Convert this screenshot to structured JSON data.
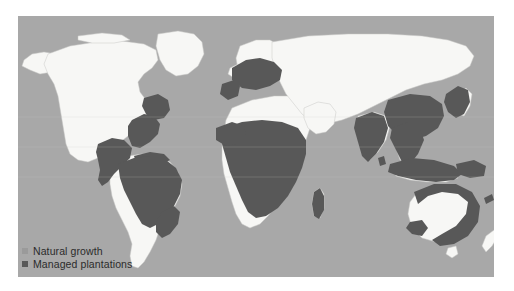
{
  "figure": {
    "type": "world-map",
    "projection": "equirectangular",
    "ocean_color": "#a8a8a8",
    "land_color": "#f7f7f5",
    "border_color": "#c9c9c7",
    "highlight_color": "#585858",
    "page_background": "#ffffff"
  },
  "legend": {
    "items": [
      {
        "label": "Natural growth",
        "color": "#9a9a9a",
        "marker": "square"
      },
      {
        "label": "Managed plantations",
        "color": "#585858",
        "marker": "square"
      }
    ]
  },
  "map_regions": {
    "natural_growth": [
      "North America (Canada, Alaska, northern & western United States)",
      "Greenland",
      "Northern Africa (Sahara)",
      "Southern Africa (Namibia, Botswana)",
      "Russia and Siberia",
      "Central Asia",
      "Arabian Peninsula",
      "Southwestern South America (Chile, Argentina)",
      "Australian interior",
      "New Zealand",
      "Scandinavia"
    ],
    "managed_plantations": [
      "Southeastern United States",
      "Mexico and Central America",
      "Caribbean islands",
      "Tropical South America (Brazil, Colombia, Venezuela, Peru, Bolivia)",
      "Sub-Saharan Africa",
      "Madagascar",
      "Central and Western Europe",
      "China",
      "India",
      "Southeast Asia",
      "Japan and Korea",
      "Indonesia and Papua New Guinea",
      "Australian coastal rim"
    ]
  }
}
